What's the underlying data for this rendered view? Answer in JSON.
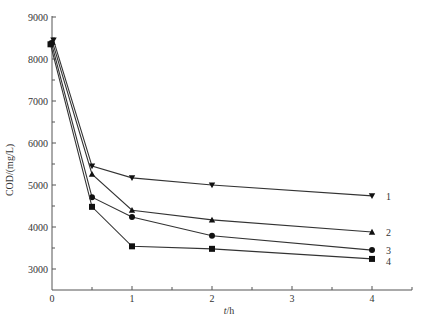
{
  "chart_data": {
    "type": "line",
    "title": "",
    "xlabel": "t/h",
    "ylabel": "COD/(mg/L)",
    "xlim": [
      0,
      4.5
    ],
    "ylim": [
      2500,
      9000
    ],
    "xticks": [
      0,
      1,
      2,
      3,
      4
    ],
    "yticks": [
      3000,
      4000,
      5000,
      6000,
      7000,
      8000,
      9000
    ],
    "grid": false,
    "legend_position": "inline-right",
    "x": [
      0,
      0.5,
      1,
      2,
      4
    ],
    "series": [
      {
        "name": "1",
        "marker": "triangle-down",
        "values": [
          8450,
          5450,
          5170,
          5000,
          4740
        ]
      },
      {
        "name": "2",
        "marker": "triangle-up",
        "values": [
          8400,
          5260,
          4400,
          4170,
          3880
        ]
      },
      {
        "name": "3",
        "marker": "circle",
        "values": [
          8380,
          4710,
          4240,
          3790,
          3450
        ]
      },
      {
        "name": "4",
        "marker": "square",
        "values": [
          8350,
          4480,
          3540,
          3480,
          3240
        ]
      }
    ]
  },
  "axes": {
    "x_label_t": "t",
    "x_label_rest": "/h",
    "y_label": "COD/(mg/L)"
  },
  "colors": {
    "line": "#333333",
    "axis": "#555555"
  }
}
